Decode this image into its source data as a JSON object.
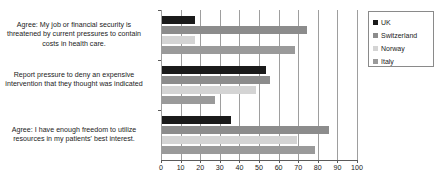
{
  "chart_data": {
    "type": "bar",
    "orientation": "horizontal",
    "title": "",
    "xlabel": "",
    "ylabel": "",
    "xlim": [
      0,
      100
    ],
    "xticks": [
      0,
      10,
      20,
      30,
      40,
      50,
      60,
      70,
      80,
      90,
      100
    ],
    "grid": true,
    "legend_position": "right",
    "categories": [
      "Agree: My job or financial security is threatened by current pressures to contain costs in health care.",
      "Report pressure to deny an expensive intervention that they thought was indicated",
      "Agree: I have enough freedom to utilize resources in my patients' best interest."
    ],
    "series": [
      {
        "name": "UK",
        "color": "#1a1a1a",
        "values": [
          17,
          53,
          35
        ]
      },
      {
        "name": "Switzerland",
        "color": "#8c8c8c",
        "values": [
          74,
          55,
          85
        ]
      },
      {
        "name": "Norway",
        "color": "#d4d4d4",
        "values": [
          17,
          48,
          69
        ]
      },
      {
        "name": "Italy",
        "color": "#9a9a9a",
        "values": [
          68,
          27,
          78
        ]
      }
    ]
  },
  "legend": {
    "items": [
      {
        "label": "UK",
        "color": "#1a1a1a"
      },
      {
        "label": "Switzerland",
        "color": "#8c8c8c"
      },
      {
        "label": "Norway",
        "color": "#d4d4d4"
      },
      {
        "label": "Italy",
        "color": "#9a9a9a"
      }
    ]
  }
}
